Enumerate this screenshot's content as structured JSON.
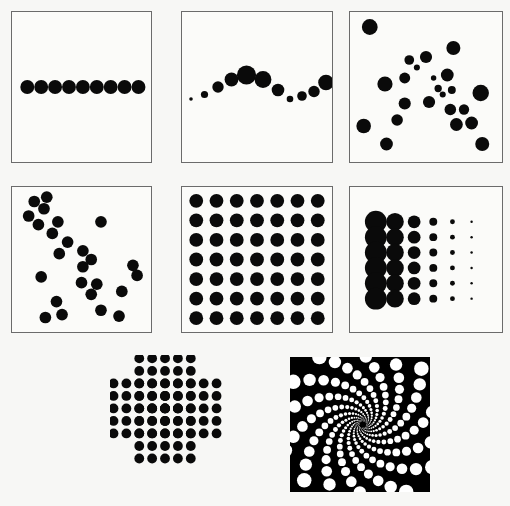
{
  "figure": {
    "background_color": "#f7f7f5",
    "frame_color": "#6b6b6b",
    "dot_color": "#0a0a0a",
    "inverted_dot_color": "#ffffff",
    "inverted_background_color": "#000000",
    "panel_count": 8
  },
  "panels": [
    {
      "id": "panel-row-of-dots",
      "label": "row-of-equal-dots",
      "index": 1,
      "framed": true,
      "inverted": false,
      "box": {
        "x": 11,
        "y": 11,
        "w": 141,
        "h": 152
      },
      "chart_data": {
        "type": "scatter",
        "title": "Row of equal dots",
        "xlabel": "",
        "ylabel": "",
        "xlim": [
          0,
          100
        ],
        "ylim": [
          0,
          100
        ],
        "grid": false,
        "legend": "none",
        "series": [
          {
            "name": "row",
            "points": [
              {
                "x": 11,
                "y": 50,
                "r": 5.0
              },
              {
                "x": 21,
                "y": 50,
                "r": 5.0
              },
              {
                "x": 31,
                "y": 50,
                "r": 5.0
              },
              {
                "x": 41,
                "y": 50,
                "r": 5.0
              },
              {
                "x": 51,
                "y": 50,
                "r": 5.0
              },
              {
                "x": 61,
                "y": 50,
                "r": 5.0
              },
              {
                "x": 71,
                "y": 50,
                "r": 5.0
              },
              {
                "x": 81,
                "y": 50,
                "r": 5.0
              },
              {
                "x": 91,
                "y": 50,
                "r": 5.0
              }
            ]
          }
        ]
      }
    },
    {
      "id": "panel-wave-of-dots",
      "label": "sine-wave-varying-size",
      "index": 2,
      "framed": true,
      "inverted": false,
      "box": {
        "x": 181,
        "y": 11,
        "w": 152,
        "h": 152
      },
      "chart_data": {
        "type": "scatter",
        "title": "Wave of dots with varying size",
        "xlabel": "",
        "ylabel": "",
        "xlim": [
          0,
          100
        ],
        "ylim": [
          0,
          100
        ],
        "grid": false,
        "legend": "none",
        "series": [
          {
            "name": "wave",
            "points": [
              {
                "x": 6,
                "y": 42,
                "r": 1.2
              },
              {
                "x": 15,
                "y": 45,
                "r": 2.4
              },
              {
                "x": 24,
                "y": 50,
                "r": 3.8
              },
              {
                "x": 33,
                "y": 55,
                "r": 4.6
              },
              {
                "x": 43,
                "y": 58,
                "r": 6.4
              },
              {
                "x": 54,
                "y": 55,
                "r": 5.6
              },
              {
                "x": 64,
                "y": 48,
                "r": 4.2
              },
              {
                "x": 72,
                "y": 42,
                "r": 2.2
              },
              {
                "x": 80,
                "y": 44,
                "r": 3.2
              },
              {
                "x": 88,
                "y": 47,
                "r": 3.8
              },
              {
                "x": 96,
                "y": 53,
                "r": 5.2
              }
            ]
          }
        ]
      }
    },
    {
      "id": "panel-scatter-varying-size",
      "label": "random-scatter-varying-size",
      "index": 3,
      "framed": true,
      "inverted": false,
      "box": {
        "x": 349,
        "y": 11,
        "w": 154,
        "h": 152
      },
      "chart_data": {
        "type": "scatter",
        "title": "Random scatter, varying dot size",
        "xlabel": "",
        "ylabel": "",
        "xlim": [
          0,
          100
        ],
        "ylim": [
          0,
          100
        ],
        "grid": false,
        "legend": "none",
        "series": [
          {
            "name": "scatter",
            "points": [
              {
                "x": 13,
                "y": 90,
                "r": 5.2
              },
              {
                "x": 68,
                "y": 76,
                "r": 4.6
              },
              {
                "x": 39,
                "y": 68,
                "r": 3.2
              },
              {
                "x": 50,
                "y": 70,
                "r": 4.0
              },
              {
                "x": 44,
                "y": 63,
                "r": 2.0
              },
              {
                "x": 36,
                "y": 56,
                "r": 3.6
              },
              {
                "x": 55,
                "y": 56,
                "r": 1.8
              },
              {
                "x": 64,
                "y": 58,
                "r": 4.2
              },
              {
                "x": 23,
                "y": 52,
                "r": 5.0
              },
              {
                "x": 58,
                "y": 49,
                "r": 2.4
              },
              {
                "x": 61,
                "y": 45,
                "r": 2.0
              },
              {
                "x": 67,
                "y": 48,
                "r": 2.6
              },
              {
                "x": 86,
                "y": 46,
                "r": 5.4
              },
              {
                "x": 36,
                "y": 39,
                "r": 4.0
              },
              {
                "x": 52,
                "y": 40,
                "r": 4.0
              },
              {
                "x": 66,
                "y": 35,
                "r": 3.8
              },
              {
                "x": 75,
                "y": 35,
                "r": 3.4
              },
              {
                "x": 31,
                "y": 28,
                "r": 3.8
              },
              {
                "x": 70,
                "y": 25,
                "r": 4.2
              },
              {
                "x": 80,
                "y": 26,
                "r": 4.2
              },
              {
                "x": 9,
                "y": 24,
                "r": 4.8
              },
              {
                "x": 24,
                "y": 12,
                "r": 4.2
              },
              {
                "x": 87,
                "y": 12,
                "r": 4.6
              }
            ]
          }
        ]
      }
    },
    {
      "id": "panel-negative-correlation",
      "label": "negative-correlation-scatter",
      "index": 4,
      "framed": true,
      "inverted": false,
      "box": {
        "x": 11,
        "y": 186,
        "w": 141,
        "h": 147
      },
      "chart_data": {
        "type": "scatter",
        "title": "Negatively correlated scatter, equal dots",
        "xlabel": "",
        "ylabel": "",
        "xlim": [
          0,
          100
        ],
        "ylim": [
          0,
          100
        ],
        "grid": false,
        "legend": "none",
        "series": [
          {
            "name": "cloud",
            "points": [
              {
                "x": 16,
                "y": 90,
                "r": 4.2
              },
              {
                "x": 25,
                "y": 93,
                "r": 4.2
              },
              {
                "x": 23,
                "y": 85,
                "r": 4.2
              },
              {
                "x": 12,
                "y": 80,
                "r": 4.2
              },
              {
                "x": 19,
                "y": 74,
                "r": 4.2
              },
              {
                "x": 33,
                "y": 76,
                "r": 4.2
              },
              {
                "x": 29,
                "y": 68,
                "r": 4.2
              },
              {
                "x": 64,
                "y": 76,
                "r": 4.2
              },
              {
                "x": 40,
                "y": 62,
                "r": 4.2
              },
              {
                "x": 34,
                "y": 54,
                "r": 4.2
              },
              {
                "x": 51,
                "y": 56,
                "r": 4.2
              },
              {
                "x": 57,
                "y": 50,
                "r": 4.2
              },
              {
                "x": 51,
                "y": 45,
                "r": 4.2
              },
              {
                "x": 87,
                "y": 46,
                "r": 4.2
              },
              {
                "x": 90,
                "y": 39,
                "r": 4.2
              },
              {
                "x": 21,
                "y": 38,
                "r": 4.2
              },
              {
                "x": 50,
                "y": 34,
                "r": 4.2
              },
              {
                "x": 61,
                "y": 33,
                "r": 4.2
              },
              {
                "x": 79,
                "y": 28,
                "r": 4.2
              },
              {
                "x": 57,
                "y": 26,
                "r": 4.2
              },
              {
                "x": 32,
                "y": 21,
                "r": 4.2
              },
              {
                "x": 64,
                "y": 15,
                "r": 4.2
              },
              {
                "x": 36,
                "y": 12,
                "r": 4.2
              },
              {
                "x": 24,
                "y": 10,
                "r": 4.2
              },
              {
                "x": 77,
                "y": 11,
                "r": 4.2
              }
            ]
          }
        ]
      }
    },
    {
      "id": "panel-regular-grid",
      "label": "regular-grid-equal-dots",
      "index": 5,
      "framed": true,
      "inverted": false,
      "box": {
        "x": 181,
        "y": 186,
        "w": 152,
        "h": 147
      },
      "chart_data": {
        "type": "heatmap",
        "title": "Uniform 7 by 7 dot lattice",
        "xlabel": "",
        "ylabel": "",
        "rows": 7,
        "cols": 7,
        "grid": false,
        "legend": "none",
        "uniform_radius": 4.6,
        "values": [
          [
            1,
            1,
            1,
            1,
            1,
            1,
            1
          ],
          [
            1,
            1,
            1,
            1,
            1,
            1,
            1
          ],
          [
            1,
            1,
            1,
            1,
            1,
            1,
            1
          ],
          [
            1,
            1,
            1,
            1,
            1,
            1,
            1
          ],
          [
            1,
            1,
            1,
            1,
            1,
            1,
            1
          ],
          [
            1,
            1,
            1,
            1,
            1,
            1,
            1
          ],
          [
            1,
            1,
            1,
            1,
            1,
            1,
            1
          ]
        ]
      }
    },
    {
      "id": "panel-size-gradient-grid",
      "label": "size-gradient-grid",
      "index": 6,
      "framed": true,
      "inverted": false,
      "box": {
        "x": 349,
        "y": 186,
        "w": 154,
        "h": 147
      },
      "chart_data": {
        "type": "heatmap",
        "title": "Grid with dot size decreasing left to right",
        "xlabel": "",
        "ylabel": "",
        "rows": 6,
        "cols": 6,
        "grid": false,
        "legend": "none",
        "column_radii": [
          7.2,
          5.8,
          4.2,
          2.6,
          1.6,
          0.8
        ],
        "values": [
          [
            7.2,
            5.8,
            4.2,
            2.6,
            1.6,
            0.8
          ],
          [
            7.2,
            5.8,
            4.2,
            2.6,
            1.6,
            0.8
          ],
          [
            7.2,
            5.8,
            4.2,
            2.6,
            1.6,
            0.8
          ],
          [
            7.2,
            5.8,
            4.2,
            2.6,
            1.6,
            0.8
          ],
          [
            7.2,
            5.8,
            4.2,
            2.6,
            1.6,
            0.8
          ],
          [
            7.2,
            5.8,
            4.2,
            2.6,
            1.6,
            0.8
          ]
        ]
      }
    },
    {
      "id": "panel-pinwheel",
      "label": "pinwheel-of-dot-blocks",
      "index": 7,
      "framed": false,
      "inverted": false,
      "box": {
        "x": 110,
        "y": 355,
        "w": 140,
        "h": 136
      },
      "chart_data": {
        "type": "heatmap",
        "title": "Pinwheel arrangement of four L shaped dot blocks",
        "xlabel": "",
        "ylabel": "",
        "grid": false,
        "legend": "none",
        "cell": 9.2,
        "dot_radius": 3.5,
        "arms": 4,
        "arm_cells": [
          [
            0,
            0
          ],
          [
            1,
            0
          ],
          [
            2,
            0
          ],
          [
            3,
            0
          ],
          [
            4,
            0
          ],
          [
            0,
            1
          ],
          [
            1,
            1
          ],
          [
            2,
            1
          ],
          [
            3,
            1
          ],
          [
            4,
            1
          ],
          [
            0,
            2
          ],
          [
            1,
            2
          ],
          [
            2,
            2
          ],
          [
            3,
            2
          ],
          [
            4,
            2
          ],
          [
            0,
            3
          ],
          [
            1,
            3
          ],
          [
            2,
            3
          ],
          [
            0,
            4
          ],
          [
            1,
            4
          ],
          [
            2,
            4
          ],
          [
            0,
            5
          ],
          [
            1,
            5
          ],
          [
            2,
            5
          ]
        ],
        "arm_origins": [
          {
            "col": 2,
            "row": 0,
            "rotation": 0
          },
          {
            "col": 8,
            "row": 2,
            "rotation": 90
          },
          {
            "col": 6,
            "row": 8,
            "rotation": 180
          },
          {
            "col": 0,
            "row": 6,
            "rotation": 270
          }
        ]
      }
    },
    {
      "id": "panel-spiral",
      "label": "logarithmic-spiral-inverted",
      "index": 8,
      "framed": false,
      "inverted": true,
      "box": {
        "x": 290,
        "y": 357,
        "w": 140,
        "h": 135
      },
      "chart_data": {
        "type": "scatter",
        "title": "Logarithmic spiral of white dots on black",
        "xlabel": "",
        "ylabel": "",
        "xlim": [
          0,
          100
        ],
        "ylim": [
          0,
          100
        ],
        "grid": false,
        "legend": "none",
        "background": "#000000",
        "dot_color": "#ffffff",
        "arms": 14,
        "points_per_arm": 26,
        "growth_rate": 0.155,
        "start_radius": 2.2,
        "center": {
          "x": 52,
          "y": 50
        }
      }
    }
  ]
}
